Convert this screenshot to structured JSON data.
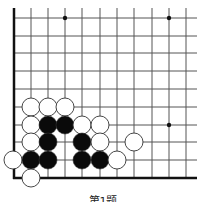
{
  "diagram": {
    "caption": "第1题",
    "colors": {
      "line": "#555555",
      "edge": "#111111",
      "black": "#0a0a0a",
      "white": "#ffffff",
      "stone_outline": "#333333"
    },
    "grid": {
      "x_lines": [
        14,
        31,
        48,
        65,
        82,
        100,
        117,
        134,
        152,
        169,
        186
      ],
      "y_lines": [
        18,
        36,
        53,
        71,
        89,
        107,
        125,
        142,
        160,
        178
      ],
      "top_extent": 8,
      "right_extent": 197,
      "left_edge_x": 14,
      "bottom_edge_y": 178
    },
    "star_points": [
      {
        "x": 65,
        "y": 18
      },
      {
        "x": 169,
        "y": 18
      },
      {
        "x": 169,
        "y": 125
      }
    ],
    "stone_radius": 9,
    "stones": [
      {
        "color": "white",
        "x": 31,
        "y": 107
      },
      {
        "color": "white",
        "x": 48,
        "y": 107
      },
      {
        "color": "white",
        "x": 65,
        "y": 107
      },
      {
        "color": "white",
        "x": 31,
        "y": 125
      },
      {
        "color": "black",
        "x": 48,
        "y": 125
      },
      {
        "color": "black",
        "x": 65,
        "y": 125
      },
      {
        "color": "white",
        "x": 82,
        "y": 125
      },
      {
        "color": "white",
        "x": 100,
        "y": 125
      },
      {
        "color": "white",
        "x": 31,
        "y": 142
      },
      {
        "color": "black",
        "x": 48,
        "y": 142
      },
      {
        "color": "black",
        "x": 82,
        "y": 142
      },
      {
        "color": "white",
        "x": 100,
        "y": 142
      },
      {
        "color": "white",
        "x": 134,
        "y": 142
      },
      {
        "color": "white",
        "x": 13,
        "y": 160
      },
      {
        "color": "black",
        "x": 31,
        "y": 160
      },
      {
        "color": "black",
        "x": 48,
        "y": 160
      },
      {
        "color": "black",
        "x": 82,
        "y": 160
      },
      {
        "color": "black",
        "x": 100,
        "y": 160
      },
      {
        "color": "white",
        "x": 117,
        "y": 160
      },
      {
        "color": "white",
        "x": 31,
        "y": 178
      }
    ]
  }
}
